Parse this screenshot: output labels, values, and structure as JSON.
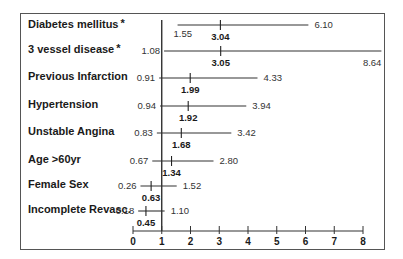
{
  "chart_data": {
    "type": "forest",
    "title": "",
    "xlabel": "",
    "ylabel": "",
    "xlim": [
      0,
      8
    ],
    "x_ticks": [
      "0",
      "1",
      "2",
      "3",
      "4",
      "5",
      "6",
      "7",
      "8"
    ],
    "reference_line": 1,
    "grid": false,
    "rows": [
      {
        "label": "Diabetes mellitus",
        "star": true,
        "lower": 1.55,
        "estimate": 3.04,
        "upper": 6.1,
        "lower_text": "1.55",
        "estimate_text": "3.04",
        "upper_text": "6.10"
      },
      {
        "label": "3 vessel disease",
        "star": true,
        "lower": 1.08,
        "estimate": 3.05,
        "upper": 8.64,
        "lower_text": "1.08",
        "estimate_text": "3.05",
        "upper_text": "8.64"
      },
      {
        "label": "Previous Infarction",
        "star": false,
        "lower": 0.91,
        "estimate": 1.99,
        "upper": 4.33,
        "lower_text": "0.91",
        "estimate_text": "1.99",
        "upper_text": "4.33"
      },
      {
        "label": "Hypertension",
        "star": false,
        "lower": 0.94,
        "estimate": 1.92,
        "upper": 3.94,
        "lower_text": "0.94",
        "estimate_text": "1.92",
        "upper_text": "3.94"
      },
      {
        "label": "Unstable Angina",
        "star": false,
        "lower": 0.83,
        "estimate": 1.68,
        "upper": 3.42,
        "lower_text": "0.83",
        "estimate_text": "1.68",
        "upper_text": "3.42"
      },
      {
        "label": "Age >60yr",
        "star": false,
        "lower": 0.67,
        "estimate": 1.34,
        "upper": 2.8,
        "lower_text": "0.67",
        "estimate_text": "1.34",
        "upper_text": "2.80"
      },
      {
        "label": "Female Sex",
        "star": false,
        "lower": 0.26,
        "estimate": 0.63,
        "upper": 1.52,
        "lower_text": "0.26",
        "estimate_text": "0.63",
        "upper_text": "1.52"
      },
      {
        "label": "Incomplete Revasc.",
        "star": false,
        "lower": 0.18,
        "estimate": 0.45,
        "upper": 1.1,
        "lower_text": "0.18",
        "estimate_text": "0.45",
        "upper_text": "1.10"
      }
    ],
    "star_symbol": "*"
  }
}
